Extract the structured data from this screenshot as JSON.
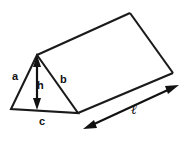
{
  "figure": {
    "name": "triangular-prism",
    "background_color": "#ffffff",
    "stroke_color": "#1a1a1a",
    "labels": {
      "side_a": "a",
      "side_b": "b",
      "base_c": "c",
      "height_h": "h",
      "length_l": "ℓ"
    },
    "geometry": {
      "front_apex": [
        37,
        55
      ],
      "front_bottom_left": [
        11,
        109
      ],
      "front_bottom_right": [
        78,
        113
      ],
      "back_apex": [
        130,
        13
      ],
      "back_bottom_right": [
        173,
        73
      ],
      "height_arrow_from": [
        37,
        58
      ],
      "height_arrow_to": [
        37,
        108
      ],
      "length_arrow_from": [
        85,
        128
      ],
      "length_arrow_to": [
        177,
        86
      ]
    }
  }
}
